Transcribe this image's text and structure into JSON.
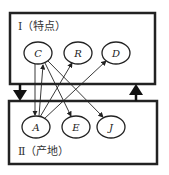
{
  "diagram": {
    "top_box": {
      "label": "Ⅰ（特点）",
      "nodes": [
        "C",
        "R",
        "D"
      ]
    },
    "bottom_box": {
      "label": "Ⅱ（产地）",
      "nodes": [
        "A",
        "E",
        "J"
      ]
    },
    "edges": [
      {
        "from": "C",
        "to": "A"
      },
      {
        "from": "A",
        "to": "C"
      },
      {
        "from": "C",
        "to": "E"
      },
      {
        "from": "C",
        "to": "J"
      },
      {
        "from": "A",
        "to": "R"
      },
      {
        "from": "A",
        "to": "D"
      }
    ],
    "big_arrows": [
      {
        "direction": "down",
        "from": "top_box",
        "to": "bottom_box"
      },
      {
        "direction": "up",
        "from": "bottom_box",
        "to": "top_box"
      }
    ]
  }
}
